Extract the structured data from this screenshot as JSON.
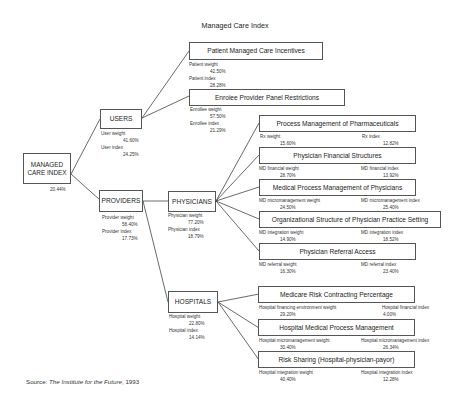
{
  "title": "Managed Care Index",
  "root": {
    "label_line1": "MANAGED",
    "label_line2": "CARE INDEX",
    "value": "20.44%"
  },
  "users": {
    "label": "USERS",
    "weight_label": "User weight",
    "weight": "41.60%",
    "index_label": "User index",
    "index": "24.25%",
    "children": [
      {
        "label": "Patient Managed Care Incentives",
        "weight_label": "Patient weight",
        "weight": "42.50%",
        "index_label": "Patient index",
        "index": "28.28%"
      },
      {
        "label": "Enroiee Provider Panel Restrictions",
        "weight_label": "Enrollee weight",
        "weight": "57.50%",
        "index_label": "Enrollee index",
        "index": "21.29%"
      }
    ]
  },
  "providers": {
    "label": "PROVIDERS",
    "weight_label": "Provider weight",
    "weight": "58.40%",
    "index_label": "Provider index",
    "index": "17.73%"
  },
  "physicians": {
    "label": "PHYSICIANS",
    "weight_label": "Physician weight",
    "weight": "77.20%",
    "index_label": "Physician index",
    "index": "18.79%",
    "children": [
      {
        "label": "Process Management of Pharmaceuticals",
        "weight_label": "Rx weight",
        "weight": "15.60%",
        "index_label": "Rx index",
        "index": "12.82%"
      },
      {
        "label": "Physician Financial Structures",
        "weight_label": "MD financial weight",
        "weight": "28.70%",
        "index_label": "MD financial index",
        "index": "13.92%"
      },
      {
        "label": "Medical Process Management of Physicians",
        "weight_label": "MD micromanagement weight",
        "weight": "24.50%",
        "index_label": "MD micromanagement index",
        "index": "25.40%"
      },
      {
        "label": "Organizational Structure of Physician Practice Setting",
        "weight_label": "MD integration weight",
        "weight": "14.90%",
        "index_label": "MD integration index",
        "index": "18.52%"
      },
      {
        "label": "Physician Referral Access",
        "weight_label": "MD referral weight",
        "weight": "16.30%",
        "index_label": "MD referral index",
        "index": "23.40%"
      }
    ]
  },
  "hospitals": {
    "label": "HOSPITALS",
    "weight_label": "Hospital weight",
    "weight": "22.80%",
    "index_label": "Hospital index",
    "index": "14.14%",
    "children": [
      {
        "label": "Medicare Risk Contracting Percentage",
        "weight_label": "Hospital financing environment weight",
        "weight": "29.20%",
        "index_label": "Hospital financial index",
        "index": "4.00%"
      },
      {
        "label": "Hospital Medical Process Management",
        "weight_label": "Hospital micromanagement weight",
        "weight": "30.40%",
        "index_label": "Hospital micromanagement index",
        "index": "26.34%"
      },
      {
        "label": "Risk Sharing (Hospital-physician-payor)",
        "weight_label": "Hospital integration weight",
        "weight": "40.40%",
        "index_label": "Hospital integration index",
        "index": "12.28%"
      }
    ]
  },
  "source": {
    "prefix": "Source: ",
    "publisher": "The Institute for the Future",
    "year": ", 1993"
  }
}
